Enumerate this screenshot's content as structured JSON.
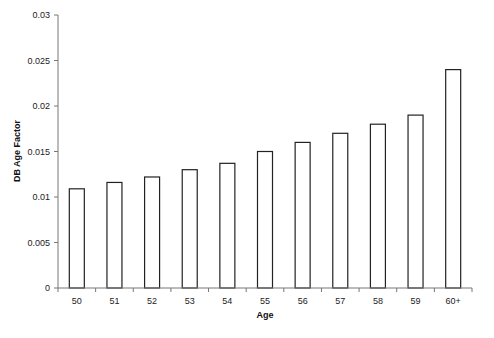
{
  "chart_data": {
    "type": "bar",
    "title": "",
    "xlabel": "Age",
    "ylabel": "DB Age Factor",
    "categories": [
      "50",
      "51",
      "52",
      "53",
      "54",
      "55",
      "56",
      "57",
      "58",
      "59",
      "60+"
    ],
    "values": [
      0.0109,
      0.0116,
      0.0122,
      0.013,
      0.0137,
      0.015,
      0.016,
      0.017,
      0.018,
      0.019,
      0.024
    ],
    "ylim": [
      0,
      0.03
    ],
    "yticks": [
      "0",
      "0.005",
      "0.01",
      "0.015",
      "0.02",
      "0.025",
      "0.03"
    ],
    "ytick_values": [
      0,
      0.005,
      0.01,
      0.015,
      0.02,
      0.025,
      0.03
    ],
    "grid": false,
    "legend": null,
    "colors": {
      "bar_fill": "#ffffff",
      "bar_stroke": "#222222",
      "axis": "#777777"
    }
  }
}
